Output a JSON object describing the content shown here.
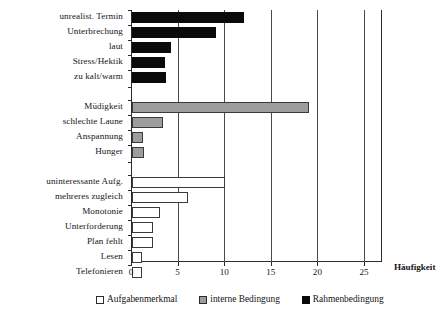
{
  "chart_data": {
    "type": "bar",
    "orientation": "horizontal",
    "title": "",
    "xlabel": "Häufigkeit",
    "ylabel": "",
    "xlim": [
      0,
      27.8
    ],
    "xticks": [
      0,
      5,
      10,
      15,
      20,
      25
    ],
    "xticklabels": [
      "0",
      "5",
      "10",
      "15",
      "20",
      "25"
    ],
    "grid": true,
    "grid_axis": "x",
    "legend_position": "bottom",
    "legend": [
      "Aufgabenmerkmal",
      "interne Bedingung",
      "Rahmenbedingung"
    ],
    "series": [
      {
        "name": "Rahmenbedingung",
        "color": "#0a0a0a",
        "categories": [
          "unrealist. Termin",
          "Unterbrechung",
          "laut",
          "Stress/Hektik",
          "zu kalt/warm"
        ],
        "values": [
          12,
          9,
          4.2,
          3.5,
          3.6
        ]
      },
      {
        "name": "interne Bedingung",
        "color": "#9d9d9d",
        "categories": [
          "Müdigkeit",
          "schlechte Laune",
          "Anspannung",
          "Hunger"
        ],
        "values": [
          19,
          3.3,
          1.2,
          1.3
        ]
      },
      {
        "name": "Aufgabenmerkmal",
        "color": "#ffffff",
        "categories": [
          "uninteressante Aufg.",
          "mehreres zugleich",
          "Monotonie",
          "Unterforderung",
          "Plan fehlt",
          "Lesen",
          "Telefonieren"
        ],
        "values": [
          10,
          6,
          3.0,
          2.2,
          2.2,
          1.1,
          1.1
        ]
      }
    ],
    "categories_in_order": [
      "unrealist. Termin",
      "Unterbrechung",
      "laut",
      "Stress/Hektik",
      "zu kalt/warm",
      "Müdigkeit",
      "schlechte Laune",
      "Anspannung",
      "Hunger",
      "uninteressante Aufg.",
      "mehreres zugleich",
      "Monotonie",
      "Unterforderung",
      "Plan fehlt",
      "Lesen",
      "Telefonieren"
    ]
  },
  "categories": [
    {
      "label": "unrealist. Termin",
      "value": 12,
      "series": "rahmen",
      "top": 2,
      "height": 11
    },
    {
      "label": "Unterbrechung",
      "value": 9,
      "series": "rahmen",
      "top": 17,
      "height": 11
    },
    {
      "label": "laut",
      "value": 4.2,
      "series": "rahmen",
      "top": 32,
      "height": 11
    },
    {
      "label": "Stress/Hektik",
      "value": 3.5,
      "series": "rahmen",
      "top": 47,
      "height": 11
    },
    {
      "label": "zu kalt/warm",
      "value": 3.6,
      "series": "rahmen",
      "top": 62,
      "height": 11
    },
    {
      "label": "Müdigkeit",
      "value": 19,
      "series": "interne",
      "top": 92,
      "height": 11
    },
    {
      "label": "schlechte Laune",
      "value": 3.3,
      "series": "interne",
      "top": 107,
      "height": 11
    },
    {
      "label": "Anspannung",
      "value": 1.2,
      "series": "interne",
      "top": 122,
      "height": 11
    },
    {
      "label": "Hunger",
      "value": 1.3,
      "series": "interne",
      "top": 137,
      "height": 11
    },
    {
      "label": "uninteressante Aufg.",
      "value": 10,
      "series": "aufgabe",
      "top": 167,
      "height": 11
    },
    {
      "label": "mehreres zugleich",
      "value": 6,
      "series": "aufgabe",
      "top": 182,
      "height": 11
    },
    {
      "label": "Monotonie",
      "value": 3.0,
      "series": "aufgabe",
      "top": 197,
      "height": 11
    },
    {
      "label": "Unterforderung",
      "value": 2.2,
      "series": "aufgabe",
      "top": 212,
      "height": 11
    },
    {
      "label": "Plan fehlt",
      "value": 2.2,
      "series": "aufgabe",
      "top": 227,
      "height": 11
    },
    {
      "label": "Lesen",
      "value": 1.1,
      "series": "aufgabe",
      "top": 242,
      "height": 11
    },
    {
      "label": "Telefonieren",
      "value": 1.1,
      "series": "aufgabe",
      "top": 257,
      "height": 11
    }
  ],
  "axis": {
    "xlabel": "Häufigkeit",
    "ticks": [
      "0",
      "5",
      "10",
      "15",
      "20",
      "25"
    ]
  },
  "legend": {
    "items": [
      {
        "label": "Aufgabenmerkmal",
        "swatch": "aufgabe"
      },
      {
        "label": "interne Bedingung",
        "swatch": "interne"
      },
      {
        "label": "Rahmenbedingung",
        "swatch": "rahmen"
      }
    ]
  }
}
